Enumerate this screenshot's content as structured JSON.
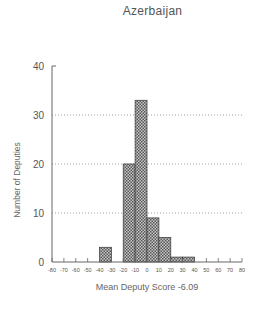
{
  "chart_data": {
    "type": "bar",
    "title": "Azerbaijan",
    "xlabel": "Mean Deputy Score -6.09",
    "ylabel": "Number of Deputies",
    "xlim": [
      -80,
      80
    ],
    "ylim": [
      0,
      40
    ],
    "x_ticks": [
      -80,
      -70,
      -60,
      -50,
      -40,
      -30,
      -20,
      -10,
      0,
      10,
      20,
      30,
      40,
      50,
      60,
      70,
      80
    ],
    "y_ticks": [
      0,
      10,
      20,
      30,
      40
    ],
    "grid": "horizontal dotted at 10, 20, 30",
    "bin_width": 10,
    "categories": [
      "-80 to -70",
      "-70 to -60",
      "-60 to -50",
      "-50 to -40",
      "-40 to -30",
      "-30 to -20",
      "-20 to -10",
      "-10 to 0",
      "0 to 10",
      "10 to 20",
      "20 to 30",
      "30 to 40",
      "40 to 50",
      "50 to 60",
      "60 to 70",
      "70 to 80"
    ],
    "bins": [
      {
        "x0": -80,
        "x1": -70,
        "count": 0
      },
      {
        "x0": -70,
        "x1": -60,
        "count": 0
      },
      {
        "x0": -60,
        "x1": -50,
        "count": 0
      },
      {
        "x0": -50,
        "x1": -40,
        "count": 0
      },
      {
        "x0": -40,
        "x1": -30,
        "count": 3
      },
      {
        "x0": -30,
        "x1": -20,
        "count": 0
      },
      {
        "x0": -20,
        "x1": -10,
        "count": 20
      },
      {
        "x0": -10,
        "x1": 0,
        "count": 33
      },
      {
        "x0": 0,
        "x1": 10,
        "count": 9
      },
      {
        "x0": 10,
        "x1": 20,
        "count": 5
      },
      {
        "x0": 20,
        "x1": 30,
        "count": 1
      },
      {
        "x0": 30,
        "x1": 40,
        "count": 1
      },
      {
        "x0": 40,
        "x1": 50,
        "count": 0
      },
      {
        "x0": 50,
        "x1": 60,
        "count": 0
      },
      {
        "x0": 60,
        "x1": 70,
        "count": 0
      },
      {
        "x0": 70,
        "x1": 80,
        "count": 0
      }
    ],
    "values": [
      0,
      0,
      0,
      0,
      3,
      0,
      20,
      33,
      9,
      5,
      1,
      1,
      0,
      0,
      0,
      0
    ],
    "bar_fill": "crosshatch gray",
    "colors": {
      "bar_fill": "#9a9a9a",
      "bar_edge": "#444444",
      "axis": "#666666",
      "grid": "#888888",
      "text": "#555555"
    }
  }
}
